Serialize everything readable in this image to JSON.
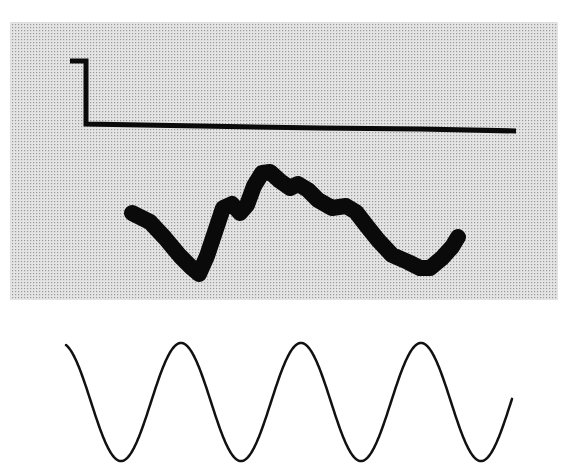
{
  "figure": {
    "width": 568,
    "height": 473,
    "background": "#ffffff"
  },
  "panel": {
    "x": 10,
    "y": 22,
    "width": 548,
    "height": 278,
    "fill": "#e4e4e4",
    "stipple_dot": "#9a9a9a",
    "stipple_spacing": 3
  },
  "traces": {
    "step": {
      "stroke": "#0a0a0a",
      "width": 5,
      "points": [
        [
          70,
          61
        ],
        [
          86,
          61
        ],
        [
          86,
          124
        ],
        [
          200,
          126
        ],
        [
          320,
          128
        ],
        [
          420,
          129
        ],
        [
          516,
          131
        ]
      ]
    },
    "response": {
      "stroke": "#0a0a0a",
      "width": 16,
      "points": [
        [
          132,
          213
        ],
        [
          150,
          222
        ],
        [
          165,
          238
        ],
        [
          180,
          256
        ],
        [
          192,
          268
        ],
        [
          199,
          274
        ],
        [
          207,
          256
        ],
        [
          215,
          232
        ],
        [
          223,
          208
        ],
        [
          232,
          204
        ],
        [
          240,
          213
        ],
        [
          247,
          205
        ],
        [
          254,
          186
        ],
        [
          262,
          173
        ],
        [
          270,
          172
        ],
        [
          280,
          181
        ],
        [
          290,
          188
        ],
        [
          298,
          184
        ],
        [
          308,
          190
        ],
        [
          318,
          200
        ],
        [
          332,
          208
        ],
        [
          346,
          206
        ],
        [
          356,
          212
        ],
        [
          366,
          225
        ],
        [
          378,
          240
        ],
        [
          392,
          255
        ],
        [
          408,
          262
        ],
        [
          420,
          268
        ],
        [
          430,
          268
        ],
        [
          442,
          258
        ],
        [
          452,
          247
        ],
        [
          458,
          237
        ]
      ]
    },
    "sine": {
      "stroke": "#111111",
      "width": 2.5,
      "x_start": 66,
      "x_end": 512,
      "center_y": 402,
      "amplitude": 59,
      "period": 120,
      "phase_x": 121,
      "note": "troughs at x~121, 238, 361, 484; peaks at x~182, 298, 421"
    }
  }
}
